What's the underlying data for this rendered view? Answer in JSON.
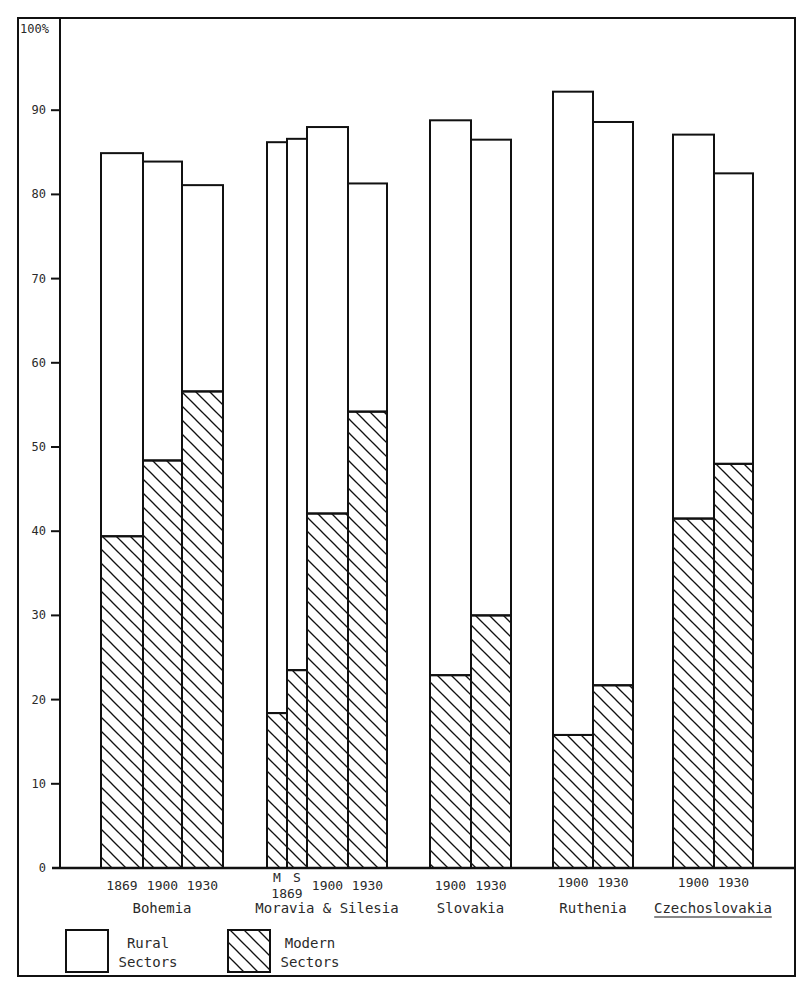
{
  "chart_data": {
    "type": "bar",
    "subtype": "stacked-overlay",
    "title": "",
    "xlabel": "",
    "ylabel": "",
    "ylim": [
      0,
      100
    ],
    "y_ticks": [
      {
        "value": 0,
        "label": "0"
      },
      {
        "value": 10,
        "label": "10"
      },
      {
        "value": 20,
        "label": "20"
      },
      {
        "value": 30,
        "label": "30"
      },
      {
        "value": 40,
        "label": "40"
      },
      {
        "value": 50,
        "label": "50"
      },
      {
        "value": 60,
        "label": "60"
      },
      {
        "value": 70,
        "label": "70"
      },
      {
        "value": 80,
        "label": "80"
      },
      {
        "value": 90,
        "label": "90"
      },
      {
        "value": 100,
        "label": "100%"
      }
    ],
    "grid": false,
    "legend_position": "bottom-left",
    "legend": [
      {
        "key": "rural",
        "label_lines": [
          "Rural",
          "Sectors"
        ],
        "pattern": "plain"
      },
      {
        "key": "modern",
        "label_lines": [
          "Modern",
          "Sectors"
        ],
        "pattern": "hatched"
      }
    ],
    "note": "Each bar's total height = total (rural+modern combined) share; hatched lower portion = modern sectors share; plain upper portion = rural sectors.",
    "groups": [
      {
        "name": "Bohemia",
        "underline": false,
        "bars": [
          {
            "label": "1869",
            "total": 84.9,
            "modern": 39.4
          },
          {
            "label": "1900",
            "total": 83.9,
            "modern": 48.4
          },
          {
            "label": "1930",
            "total": 81.1,
            "modern": 56.6
          }
        ]
      },
      {
        "name": "Moravia & Silesia",
        "underline": false,
        "bars": [
          {
            "label": "M",
            "sublabel": "1869",
            "total": 86.2,
            "modern": 18.4
          },
          {
            "label": "S",
            "sublabel": "1869",
            "total": 86.6,
            "modern": 23.5
          },
          {
            "label": "1900",
            "total": 88.0,
            "modern": 42.1
          },
          {
            "label": "1930",
            "total": 81.3,
            "modern": 54.2
          }
        ]
      },
      {
        "name": "Slovakia",
        "underline": false,
        "bars": [
          {
            "label": "1900",
            "total": 88.8,
            "modern": 22.9
          },
          {
            "label": "1930",
            "total": 86.5,
            "modern": 30.0
          }
        ]
      },
      {
        "name": "Ruthenia",
        "underline": false,
        "bars": [
          {
            "label": "1900",
            "total": 92.2,
            "modern": 15.8
          },
          {
            "label": "1930",
            "total": 88.6,
            "modern": 21.7
          }
        ]
      },
      {
        "name": "Czechoslovakia",
        "underline": true,
        "bars": [
          {
            "label": "1900",
            "total": 87.1,
            "modern": 41.5
          },
          {
            "label": "1930",
            "total": 82.5,
            "modern": 48.0
          }
        ]
      }
    ],
    "categories": [
      "Bohemia 1869",
      "Bohemia 1900",
      "Bohemia 1930",
      "Moravia 1869",
      "Silesia 1869",
      "Moravia & Silesia 1900",
      "Moravia & Silesia 1930",
      "Slovakia 1900",
      "Slovakia 1930",
      "Ruthenia 1900",
      "Ruthenia 1930",
      "Czechoslovakia 1900",
      "Czechoslovakia 1930"
    ],
    "series": [
      {
        "name": "Total (top of bar)",
        "values": [
          84.9,
          83.9,
          81.1,
          86.2,
          86.6,
          88.0,
          81.3,
          88.8,
          86.5,
          92.2,
          88.6,
          87.1,
          82.5
        ]
      },
      {
        "name": "Modern Sectors",
        "values": [
          39.4,
          48.4,
          56.6,
          18.4,
          23.5,
          42.1,
          54.2,
          22.9,
          30.0,
          15.8,
          21.7,
          41.5,
          48.0
        ]
      }
    ]
  },
  "layout": {
    "bar_x": [
      [
        [
          101,
          143
        ],
        [
          143,
          182
        ],
        [
          182,
          223
        ]
      ],
      [
        [
          267,
          287
        ],
        [
          287,
          307
        ],
        [
          307,
          348
        ],
        [
          348,
          387
        ]
      ],
      [
        [
          430,
          471
        ],
        [
          471,
          511
        ]
      ],
      [
        [
          553,
          593
        ],
        [
          593,
          633
        ]
      ],
      [
        [
          673,
          714
        ],
        [
          714,
          753
        ]
      ]
    ],
    "colors": {
      "ink": "#111111",
      "paper": "#ffffff",
      "text": "#2a2a2a"
    }
  }
}
